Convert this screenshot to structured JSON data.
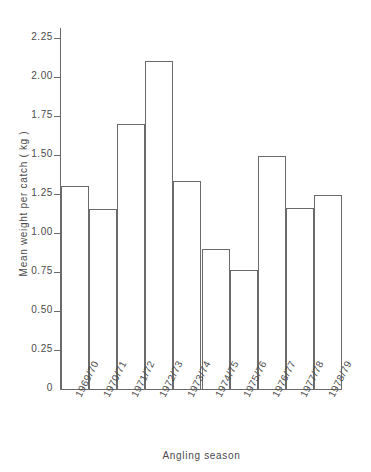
{
  "chart_data": {
    "type": "bar",
    "title": "",
    "xlabel": "Angling season",
    "ylabel": "Mean weight per catch ( kg )",
    "categories": [
      "1969/70",
      "1970/71",
      "1971/72",
      "1972/73",
      "1973/74",
      "1974/75",
      "1975/76",
      "1976/77",
      "1977/78",
      "1978/79"
    ],
    "values": [
      1.3,
      1.15,
      1.7,
      2.1,
      1.33,
      0.9,
      0.76,
      1.49,
      1.16,
      1.24
    ],
    "ylim": [
      0,
      2.3125
    ],
    "ytick_values": [
      0,
      0.25,
      0.5,
      0.75,
      1.0,
      1.25,
      1.5,
      1.75,
      2.0,
      2.25
    ],
    "ytick_labels": [
      "0",
      "0.25",
      "0.50",
      "0.75",
      "1.00",
      "1.25",
      "1.50",
      "1.75",
      "2.00",
      "2.25"
    ],
    "grid": false,
    "legend": false,
    "legend_position": "none",
    "bar_style": "outline",
    "bar_edge_color": "#6a6a6a",
    "bar_fill_color": "#ffffff",
    "axis_color": "#6a6a6a",
    "text_color": "#4a4a4a",
    "background_color": "#ffffff",
    "xtick_rotation_deg": -63
  }
}
